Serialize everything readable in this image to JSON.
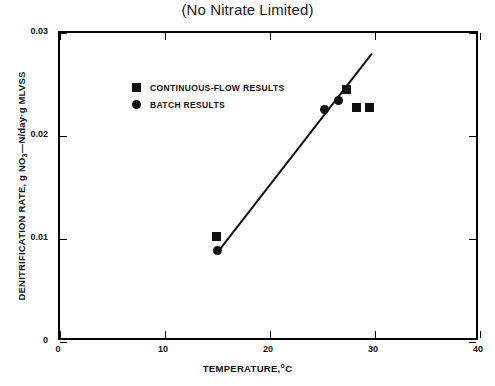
{
  "chart_data": {
    "type": "scatter",
    "title": "(No Nitrate Limited)",
    "xlabel": "TEMPERATURE,",
    "xlabel_sup": "o",
    "xlabel_unit": "C",
    "ylabel_pre": "DENITRIFICATION RATE, g NO",
    "ylabel_sub": "3",
    "ylabel_post": "—N/day·g MLVSS",
    "xlim": [
      0,
      40
    ],
    "ylim": [
      0,
      0.03
    ],
    "xticks": [
      0,
      10,
      20,
      30,
      40
    ],
    "xticklabels": [
      "0",
      "10",
      "20",
      "30",
      "40"
    ],
    "yticks": [
      0,
      0.01,
      0.02,
      0.03
    ],
    "yticklabels": [
      "0",
      "0.01",
      "0.02",
      "0.03"
    ],
    "grid": false,
    "legend_position": "upper-left-inside",
    "series": [
      {
        "name": "CONTINUOUS-FLOW RESULTS",
        "marker": "square",
        "color": "#111111",
        "points": [
          {
            "x": 14.9,
            "y": 0.0102
          },
          {
            "x": 27.3,
            "y": 0.0245
          },
          {
            "x": 28.2,
            "y": 0.0228
          },
          {
            "x": 29.5,
            "y": 0.0228
          }
        ]
      },
      {
        "name": "BATCH RESULTS",
        "marker": "circle",
        "color": "#111111",
        "points": [
          {
            "x": 15.0,
            "y": 0.0089
          },
          {
            "x": 25.2,
            "y": 0.0226
          },
          {
            "x": 26.5,
            "y": 0.0234
          }
        ]
      }
    ],
    "fit_line": {
      "name": "regression-line",
      "color": "#111111",
      "x_start": 15.0,
      "y_start": 0.0087,
      "x_end": 29.7,
      "y_end": 0.028
    }
  },
  "legend": {
    "items": [
      {
        "label": "CONTINUOUS-FLOW RESULTS",
        "marker": "square"
      },
      {
        "label": "BATCH RESULTS",
        "marker": "circle"
      }
    ]
  }
}
